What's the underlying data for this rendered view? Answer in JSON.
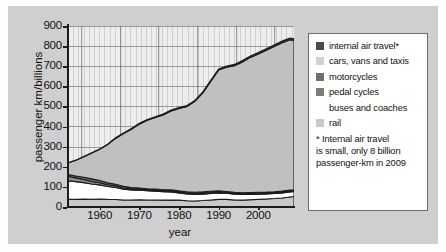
{
  "chart_data": {
    "type": "area",
    "title": "",
    "xlabel": "year",
    "ylabel": "passenger km/billions",
    "xlim": [
      1952,
      2009
    ],
    "ylim": [
      0,
      900
    ],
    "grid": true,
    "legend_position": "right",
    "xticks": [
      "1960",
      "1970",
      "1980",
      "1990",
      "2000"
    ],
    "xtick_values": [
      1960,
      1970,
      1980,
      1990,
      2000
    ],
    "yticks": [
      "0",
      "100",
      "200",
      "300",
      "400",
      "500",
      "600",
      "700",
      "800",
      "900"
    ],
    "ytick_values": [
      0,
      100,
      200,
      300,
      400,
      500,
      600,
      700,
      800,
      900
    ],
    "stacked": true,
    "x": [
      1952,
      1954,
      1956,
      1958,
      1960,
      1962,
      1964,
      1966,
      1968,
      1970,
      1972,
      1974,
      1976,
      1978,
      1980,
      1982,
      1984,
      1986,
      1988,
      1990,
      1992,
      1994,
      1996,
      1998,
      2000,
      2002,
      2004,
      2006,
      2008,
      2009
    ],
    "series": [
      {
        "name": "rail",
        "color": "#c9c9c9",
        "values": [
          38,
          38,
          39,
          38,
          40,
          38,
          37,
          35,
          35,
          36,
          35,
          35,
          34,
          35,
          34,
          31,
          30,
          32,
          35,
          38,
          38,
          35,
          34,
          36,
          38,
          40,
          42,
          45,
          50,
          52
        ]
      },
      {
        "name": "buses and coaches",
        "color": "#ffffff",
        "values": [
          92,
          88,
          82,
          76,
          70,
          64,
          60,
          54,
          50,
          48,
          46,
          44,
          42,
          40,
          36,
          34,
          32,
          32,
          32,
          32,
          30,
          29,
          28,
          27,
          26,
          25,
          25,
          25,
          25,
          25
        ]
      },
      {
        "name": "pedal cycles",
        "color": "#8f8f8f",
        "values": [
          23,
          19,
          16,
          13,
          11,
          9,
          8,
          7,
          6,
          5,
          5,
          5,
          5,
          5,
          5,
          5,
          5,
          5,
          5,
          5,
          4,
          4,
          4,
          4,
          4,
          4,
          4,
          4,
          4,
          4
        ]
      },
      {
        "name": "motorcycles",
        "color": "#6e6e6e",
        "values": [
          8,
          9,
          11,
          13,
          11,
          9,
          8,
          7,
          6,
          5,
          5,
          5,
          5,
          5,
          5,
          6,
          6,
          6,
          6,
          6,
          5,
          5,
          5,
          5,
          5,
          5,
          5,
          5,
          5,
          5
        ]
      },
      {
        "name": "cars, vans and taxis",
        "color": "#c0c0c0",
        "values": [
          58,
          78,
          102,
          128,
          155,
          190,
          228,
          262,
          290,
          318,
          340,
          356,
          372,
          392,
          410,
          424,
          452,
          492,
          546,
          600,
          618,
          630,
          650,
          672,
          688,
          706,
          722,
          738,
          748,
          742
        ]
      },
      {
        "name": "internal air travel*",
        "color": "#3c3c3c",
        "values": [
          1,
          1,
          1,
          2,
          2,
          2,
          3,
          3,
          3,
          4,
          4,
          4,
          4,
          5,
          5,
          5,
          5,
          6,
          6,
          6,
          6,
          6,
          7,
          7,
          7,
          7,
          8,
          8,
          8,
          8
        ]
      }
    ]
  },
  "legend": {
    "items": [
      {
        "label": "internal air travel*",
        "swatch": "#4a4a4a"
      },
      {
        "label": "cars, vans and taxis",
        "swatch": "#d2d2d2"
      },
      {
        "label": "motorcycles",
        "swatch": "#6e6e6e"
      },
      {
        "label": "pedal cycles",
        "swatch": "#7d7d7d"
      },
      {
        "label": "buses and coaches",
        "swatch": "transparent"
      },
      {
        "label": "rail",
        "swatch": "#c9c9c9"
      }
    ],
    "footnote_line1": "* Internal air travel",
    "footnote_line2": "is small, only 8 billion",
    "footnote_line3": "passenger-km in 2009"
  },
  "colors": {
    "panel_background": "#cfcfcf",
    "plot_background": "#ededed",
    "axis": "#1c1c1c",
    "legend_border": "#6f6f6f"
  }
}
